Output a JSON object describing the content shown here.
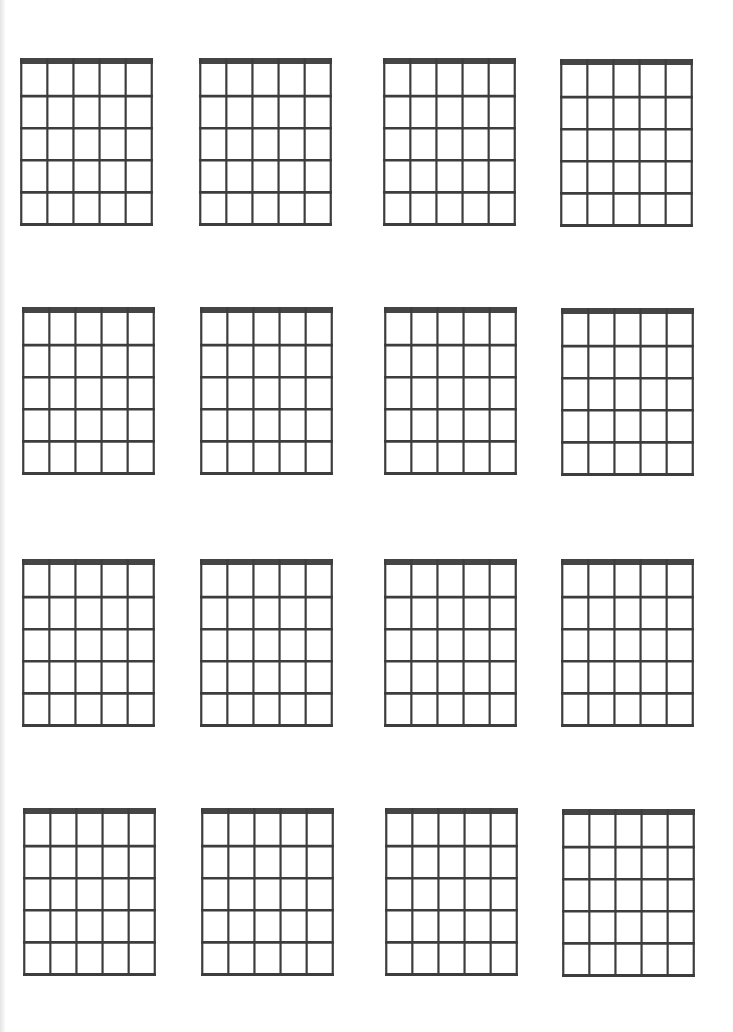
{
  "page": {
    "title": "Blank Guitar Chord Diagrams",
    "line_color": "#3d3d3d",
    "nut_color": "#454545",
    "background": "#ffffff"
  },
  "grid": {
    "rows": 4,
    "columns": 4,
    "strings_per_diagram": 6,
    "frets_per_diagram": 5
  },
  "diagrams": [
    {
      "row": 1,
      "col": 1,
      "x": 20,
      "y": 58
    },
    {
      "row": 1,
      "col": 2,
      "x": 199,
      "y": 58
    },
    {
      "row": 1,
      "col": 3,
      "x": 383,
      "y": 58
    },
    {
      "row": 1,
      "col": 4,
      "x": 560,
      "y": 59
    },
    {
      "row": 2,
      "col": 1,
      "x": 22,
      "y": 307
    },
    {
      "row": 2,
      "col": 2,
      "x": 200,
      "y": 307
    },
    {
      "row": 2,
      "col": 3,
      "x": 384,
      "y": 307
    },
    {
      "row": 2,
      "col": 4,
      "x": 561,
      "y": 308
    },
    {
      "row": 3,
      "col": 1,
      "x": 22,
      "y": 559
    },
    {
      "row": 3,
      "col": 2,
      "x": 200,
      "y": 559
    },
    {
      "row": 3,
      "col": 3,
      "x": 384,
      "y": 559
    },
    {
      "row": 3,
      "col": 4,
      "x": 561,
      "y": 559
    },
    {
      "row": 4,
      "col": 1,
      "x": 23,
      "y": 808
    },
    {
      "row": 4,
      "col": 2,
      "x": 201,
      "y": 808
    },
    {
      "row": 4,
      "col": 3,
      "x": 385,
      "y": 808
    },
    {
      "row": 4,
      "col": 4,
      "x": 562,
      "y": 809
    }
  ]
}
